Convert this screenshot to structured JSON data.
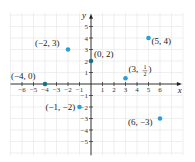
{
  "chart_data": {
    "type": "scatter",
    "title": "",
    "xlabel": "x",
    "ylabel": "y",
    "xlim": [
      -7,
      7
    ],
    "ylim": [
      -6,
      6
    ],
    "grid": true,
    "x_ticks": [
      -6,
      -5,
      -4,
      -3,
      -2,
      -1,
      1,
      2,
      3,
      4,
      5,
      6
    ],
    "y_ticks": [
      -5,
      -4,
      -3,
      -2,
      -1,
      1,
      2,
      3,
      4,
      5
    ],
    "x_tick_labels": [
      "−6",
      "−5",
      "−4",
      "−3",
      "−2",
      "−1",
      "1",
      "2",
      "3",
      "4",
      "5",
      "6"
    ],
    "y_tick_labels": [
      "−5",
      "−4",
      "−3",
      "−2",
      "−1",
      "1",
      "2",
      "3",
      "4",
      "5"
    ],
    "points": [
      {
        "x": -2,
        "y": 3,
        "label": "(−2, 3)"
      },
      {
        "x": 0,
        "y": 2,
        "label": "(0, 2)"
      },
      {
        "x": 5,
        "y": 4,
        "label": "(5, 4)"
      },
      {
        "x": -4,
        "y": 0,
        "label": "(−4, 0)"
      },
      {
        "x": 3,
        "y": 0.5,
        "label": "(3, 1/2)"
      },
      {
        "x": -1,
        "y": -2,
        "label": "(−1, −2)"
      },
      {
        "x": 6,
        "y": -3,
        "label": "(6, −3)"
      }
    ]
  },
  "colors": {
    "point": "#2a9fd6",
    "point_on_axis": "#1a6f8a",
    "grid": "#e4e4e4",
    "axis": "#222222"
  }
}
